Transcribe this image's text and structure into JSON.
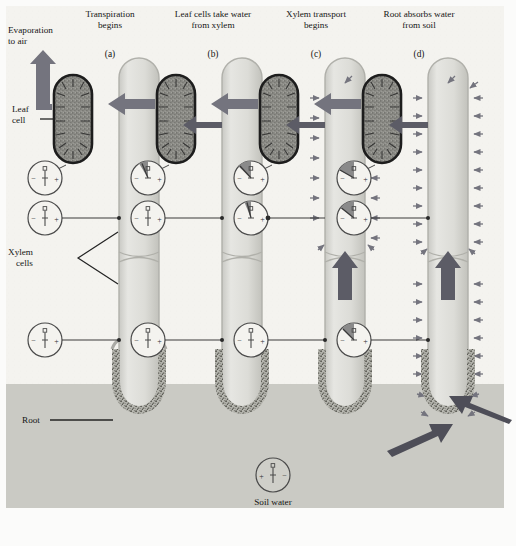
{
  "figure": {
    "domain_note": "textbook botanical diagram of water transport in a plant",
    "background_color": "#f4f3ef",
    "soil_color": "#cfcfcb",
    "xylem_fill": "#dededa",
    "xylem_edge": "#a9a9a3",
    "leafcell_fill": "#8f8f8a",
    "leafcell_edge": "#1d1d1d",
    "root_hair_color": "#6e6e68",
    "arrow_color": "#74747e",
    "arrow_dark_color": "#4e4e58",
    "gauge_stroke": "#4a4a4a",
    "gauge_sector_fill": "#8a8a8a"
  },
  "panels": [
    {
      "key": "a",
      "letter": "(a)",
      "title_line1": "Transpiration",
      "title_line2": "begins"
    },
    {
      "key": "b",
      "letter": "(b)",
      "title_line1": "Leaf cells take water",
      "title_line2": "from xylem"
    },
    {
      "key": "c",
      "letter": "(c)",
      "title_line1": "Xylem transport",
      "title_line2": "begins"
    },
    {
      "key": "d",
      "letter": "(d)",
      "title_line1": "Root absorbs water",
      "title_line2": "from soil"
    }
  ],
  "labels": {
    "evaporation_line1": "Evaporation",
    "evaporation_line2": "to air",
    "leaf_cell_line1": "Leaf",
    "leaf_cell_line2": "cell",
    "xylem_cells_line1": "Xylem",
    "xylem_cells_line2": "cells",
    "root": "Root",
    "soil_water": "Soil water"
  },
  "gauge_symbols": {
    "negative": "−",
    "positive": "+",
    "pointer_cap": "□"
  },
  "gauges": {
    "note": "tension / water-potential meters. sector = amount of negative (tension) reading",
    "panel_a": [
      {
        "position": "leaf",
        "reading": "neutral",
        "sector_degrees": 0
      },
      {
        "position": "stem",
        "reading": "neutral",
        "sector_degrees": 0
      },
      {
        "position": "root",
        "reading": "neutral",
        "sector_degrees": 0
      }
    ],
    "panel_b": [
      {
        "position": "leaf",
        "reading": "slightly negative",
        "sector_degrees": 32
      },
      {
        "position": "stem",
        "reading": "neutral",
        "sector_degrees": 0
      },
      {
        "position": "root",
        "reading": "neutral",
        "sector_degrees": 0
      }
    ],
    "panel_c": [
      {
        "position": "leaf",
        "reading": "negative",
        "sector_degrees": 48
      },
      {
        "position": "stem",
        "reading": "slightly negative",
        "sector_degrees": 22
      },
      {
        "position": "root",
        "reading": "neutral",
        "sector_degrees": 0
      }
    ],
    "panel_d": [
      {
        "position": "leaf",
        "reading": "strongly negative",
        "sector_degrees": 62
      },
      {
        "position": "stem",
        "reading": "negative",
        "sector_degrees": 50
      },
      {
        "position": "root",
        "reading": "negative",
        "sector_degrees": 44
      }
    ],
    "soil_water": {
      "position": "soil",
      "reading": "neutral positive",
      "sector_degrees": 0,
      "polarity_reversed": true
    }
  },
  "flows": {
    "evaporation_arrow": {
      "panel": "a",
      "direction": "up-left",
      "meaning": "water evaporates to air"
    },
    "leaf_outflow_arrow": {
      "panels": [
        "b",
        "c",
        "d"
      ],
      "direction": "left",
      "meaning": "water leaves the leaf cell"
    },
    "xylem_to_leaf_arrow": {
      "panels": [
        "b",
        "c",
        "d"
      ],
      "direction": "left",
      "meaning": "leaf cell pulls water from xylem"
    },
    "xylem_up_arrow": {
      "panels": [
        "c",
        "d"
      ],
      "direction": "up",
      "meaning": "water rises through the xylem"
    },
    "soil_to_root_arrows": {
      "panel": "d",
      "direction": "inward",
      "meaning": "root absorbs water from soil"
    },
    "cohesion_side_arrows": {
      "panels": [
        "c",
        "d"
      ],
      "direction": "inward",
      "meaning": "tension pulls along the water column"
    }
  },
  "caption": {
    "text": ""
  }
}
